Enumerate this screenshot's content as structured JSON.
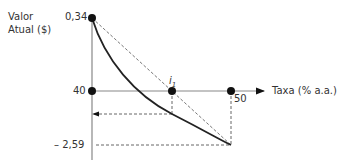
{
  "diagram": {
    "y_axis_label_line1": "Valor",
    "y_axis_label_line2": "Atual ($)",
    "x_axis_label": "Taxa (% a.a.)",
    "y_top_value": "0,34",
    "y_zero_value": "40",
    "y_bottom_value": "– 2,59",
    "x_point_label": "50",
    "irr_label": "i",
    "irr_subscript": "1",
    "colors": {
      "axis": "#888888",
      "curve": "#222222",
      "dashed": "#555555",
      "point": "#111111"
    }
  }
}
